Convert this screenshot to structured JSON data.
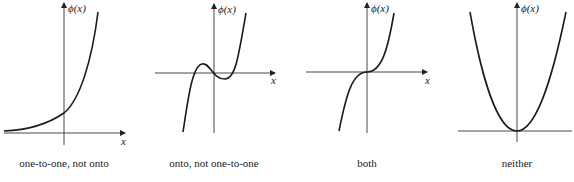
{
  "figure": {
    "panels": [
      {
        "id": "exp",
        "caption": "one-to-one, not onto",
        "y_label": "ϕ(x)",
        "x_label": "x",
        "axis_origin": [
          64,
          133
        ],
        "x_axis": [
          4,
          125
        ],
        "y_axis": [
          3,
          145
        ],
        "curve": "M4,131 C30,130 48,124 64,113 C80,100 92,60 98,12",
        "y_label_pos": [
          68,
          12
        ],
        "x_label_pos": [
          121,
          145
        ]
      },
      {
        "id": "cubic-wiggle",
        "caption": "onto, not one-to-one",
        "y_label": "ϕ(x)",
        "x_label": "x",
        "axis_origin": [
          214,
          73
        ],
        "x_axis": [
          155,
          275
        ],
        "y_axis": [
          4,
          133
        ],
        "curve": "M183,132 C188,100 192,66 202,64 C210,62 212,79 225,79 C235,79 238,60 246,13",
        "y_label_pos": [
          218,
          13
        ],
        "x_label_pos": [
          271,
          84
        ]
      },
      {
        "id": "cubic",
        "caption": "both",
        "y_label": "ϕ(x)",
        "x_label": "x",
        "axis_origin": [
          367,
          72
        ],
        "x_axis": [
          306,
          427
        ],
        "y_axis": [
          3,
          133
        ],
        "curve": "M339,131 C346,96 352,72 367,72 C382,72 388,48 394,13",
        "y_label_pos": [
          371,
          12
        ],
        "x_label_pos": [
          425,
          84
        ]
      },
      {
        "id": "parabola",
        "caption": "neither",
        "y_label": "ϕ(x)",
        "x_label": "",
        "axis_origin": [
          517,
          131
        ],
        "x_axis": [
          458,
          572
        ],
        "y_axis": [
          3,
          142
        ],
        "curve": "M470,12 C482,80 498,131 517,131 C536,131 552,80 566,12",
        "y_label_pos": [
          521,
          12
        ],
        "x_label_pos": [
          0,
          0
        ]
      }
    ],
    "stroke_color": "#1a1a1a",
    "axis_color": "#333333"
  }
}
